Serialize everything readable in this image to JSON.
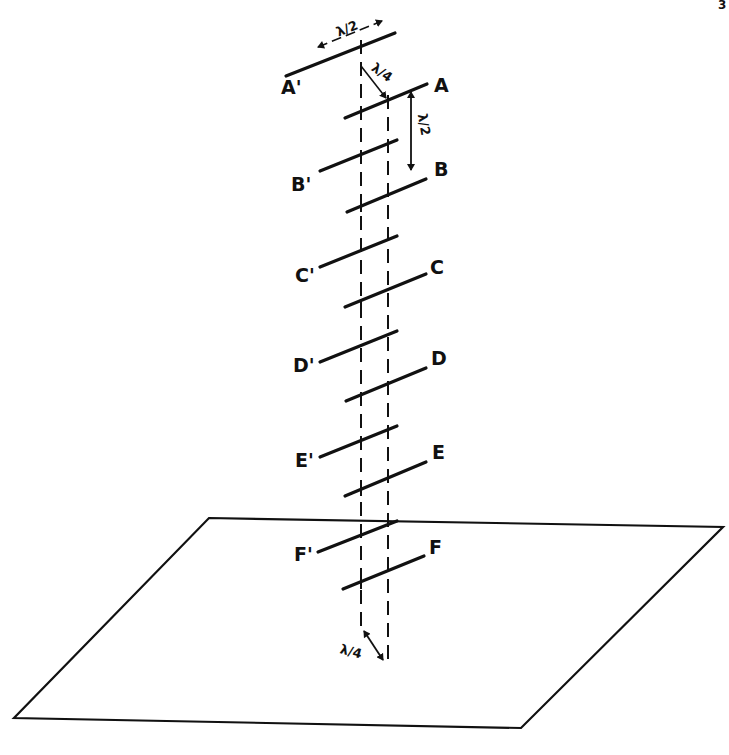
{
  "page": {
    "number_fragment": "3"
  },
  "colors": {
    "ink": "#111111",
    "background": "#ffffff"
  },
  "labels": {
    "A_prime": "A'",
    "A": "A",
    "B_prime": "B'",
    "B": "B",
    "C_prime": "C'",
    "C": "C",
    "D_prime": "D'",
    "D": "D",
    "E_prime": "E'",
    "E": "E",
    "F_prime": "F'",
    "F": "F"
  },
  "dimensions": {
    "dipole_length": "λ/2",
    "spacing_top": "λ/4",
    "vertical_spacing": "λ/2",
    "spacing_bottom": "λ/4"
  },
  "geometry": {
    "ground_plane": [
      [
        209,
        518
      ],
      [
        723,
        527
      ],
      [
        521,
        728
      ],
      [
        14,
        718
      ]
    ],
    "dashed_left_x": 361,
    "dashed_right_x": 388,
    "elements_primed": [
      {
        "x1": 285,
        "y1": 76,
        "x2": 395,
        "y2": 32
      },
      {
        "x1": 320,
        "y1": 172,
        "x2": 398,
        "y2": 140
      },
      {
        "x1": 320,
        "y1": 268,
        "x2": 398,
        "y2": 236
      },
      {
        "x1": 320,
        "y1": 363,
        "x2": 398,
        "y2": 331
      },
      {
        "x1": 320,
        "y1": 458,
        "x2": 398,
        "y2": 426
      },
      {
        "x1": 318,
        "y1": 553,
        "x2": 398,
        "y2": 521
      }
    ],
    "elements_unprimed": [
      {
        "x1": 345,
        "y1": 117,
        "x2": 427,
        "y2": 83
      },
      {
        "x1": 347,
        "y1": 211,
        "x2": 426,
        "y2": 178
      },
      {
        "x1": 345,
        "y1": 307,
        "x2": 426,
        "y2": 273
      },
      {
        "x1": 346,
        "y1": 401,
        "x2": 426,
        "y2": 368
      },
      {
        "x1": 345,
        "y1": 496,
        "x2": 426,
        "y2": 462
      },
      {
        "x1": 343,
        "y1": 589,
        "x2": 424,
        "y2": 556
      }
    ],
    "feeders_left": [
      {
        "x1": 345,
        "y1": 117,
        "x2": 361,
        "y2": 110
      },
      {
        "x1": 347,
        "y1": 211,
        "x2": 361,
        "y2": 205
      },
      {
        "x1": 345,
        "y1": 307,
        "x2": 361,
        "y2": 300
      },
      {
        "x1": 346,
        "y1": 401,
        "x2": 361,
        "y2": 395
      },
      {
        "x1": 345,
        "y1": 496,
        "x2": 361,
        "y2": 489
      },
      {
        "x1": 343,
        "y1": 589,
        "x2": 361,
        "y2": 582
      }
    ]
  }
}
